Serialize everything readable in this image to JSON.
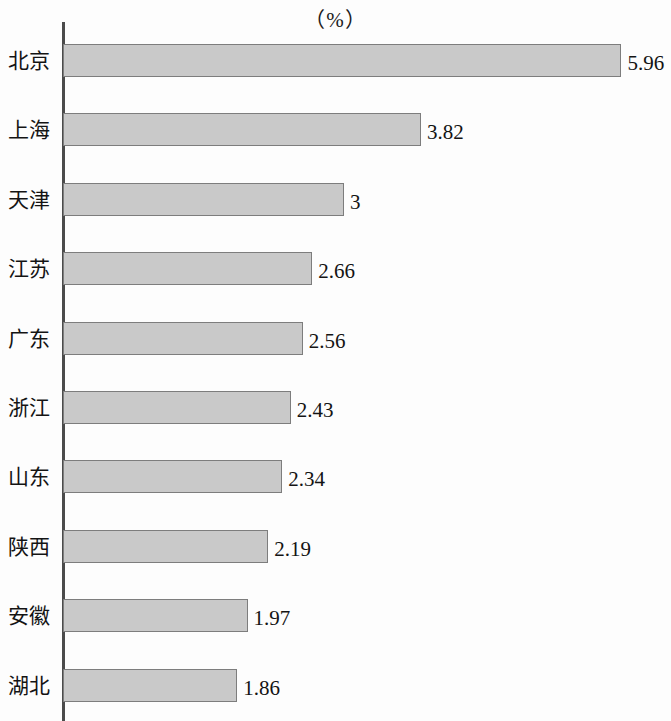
{
  "chart_data": {
    "type": "bar",
    "orientation": "horizontal",
    "title": "（%）",
    "xlabel": "",
    "ylabel": "",
    "unit": "%",
    "grid": false,
    "legend": null,
    "xlim": [
      0,
      6.2
    ],
    "categories": [
      "北京",
      "上海",
      "天津",
      "江苏",
      "广东",
      "浙江",
      "山东",
      "陕西",
      "安徽",
      "湖北"
    ],
    "values": [
      5.96,
      3.82,
      3,
      2.66,
      2.56,
      2.43,
      2.34,
      2.19,
      1.97,
      1.86
    ],
    "value_labels": [
      "5.96",
      "3.82",
      "3",
      "2.66",
      "2.56",
      "2.43",
      "2.34",
      "2.19",
      "1.97",
      "1.86"
    ],
    "bar_color": "#c9c9c9",
    "bar_border_color": "#7d7d7d",
    "axis_color": "#4b4b4b"
  }
}
